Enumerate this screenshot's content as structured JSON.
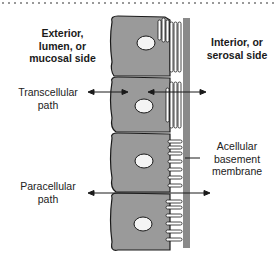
{
  "diagram": {
    "labels": {
      "exterior": [
        "Exterior,",
        "lumen, or",
        "mucosal side"
      ],
      "interior": [
        "Interior, or",
        "serosal side"
      ],
      "transcellular": [
        "Transcellular",
        "path"
      ],
      "paracellular": [
        "Paracellular",
        "path"
      ],
      "basement": [
        "Acellular",
        "basement",
        "membrane"
      ]
    },
    "cell_count": 4,
    "colors": {
      "cell_fill": "#9a9a9a",
      "cell_outline": "#1a1a1a",
      "nucleus_fill": "#f4f4f4",
      "membrane": "#8a8a8a",
      "arrow": "#1a1a1a"
    }
  }
}
